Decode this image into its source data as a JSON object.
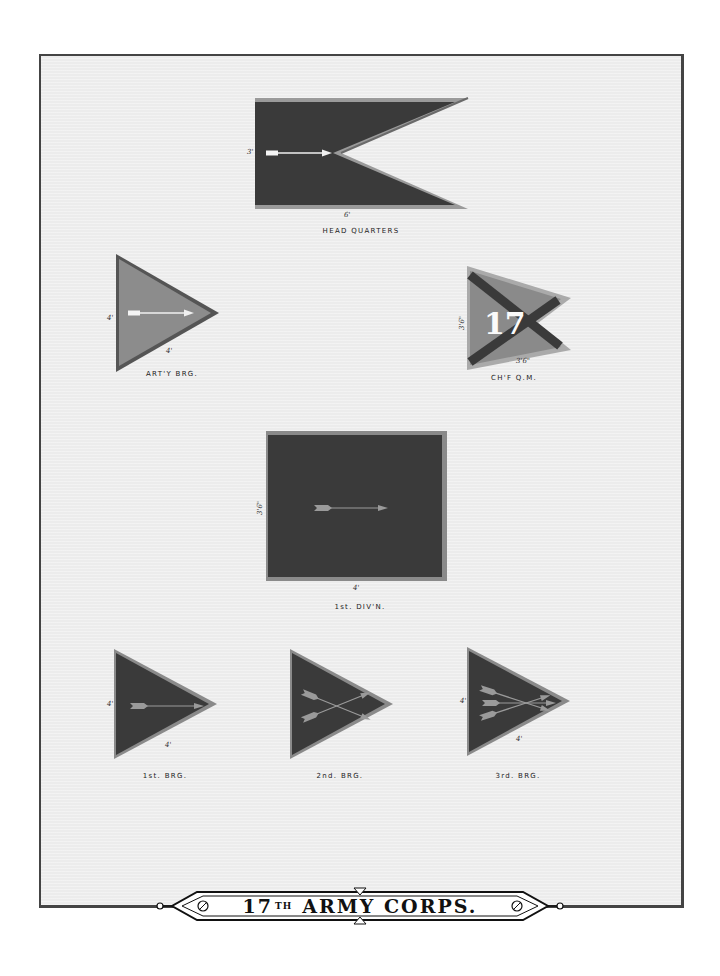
{
  "plate": {
    "title_number": "17",
    "title_suffix": "TH",
    "title_main": "ARMY CORPS.",
    "paper_color": "#ececec",
    "frame_color": "#444444"
  },
  "flags": [
    {
      "id": "head-quarters",
      "caption": "HEAD QUARTERS",
      "shape": "swallowtail",
      "field_color": "#3a3a3a",
      "border_color": "#9a9a9a",
      "emblem": "one white arrow",
      "dim_vertical": "3'",
      "dim_horizontal": "6'"
    },
    {
      "id": "arty-brig",
      "caption": "ART'Y BRG.",
      "shape": "triangle",
      "field_color": "#8c8c8c",
      "border_color": "#555555",
      "emblem": "one white arrow",
      "dim_vertical": "4'",
      "dim_horizontal": "4'"
    },
    {
      "id": "chief-qm",
      "caption": "CH'F Q.M.",
      "shape": "swallowtail-triangle",
      "field_color": "#8a8a8a",
      "border_color": "#aaaaaa",
      "emblem": "dark saltire with numeral",
      "numeral": "17",
      "dim_vertical": "3'6\"",
      "dim_horizontal": "3'6\""
    },
    {
      "id": "1st-divn",
      "caption": "1st. DIV'N.",
      "shape": "square",
      "field_color": "#3a3a3a",
      "border_color": "#8a8a8a",
      "emblem": "one arrow",
      "dim_vertical": "3'6\"",
      "dim_horizontal": "4'"
    },
    {
      "id": "1st-brg",
      "caption": "1st. BRG.",
      "shape": "triangle",
      "field_color": "#3a3a3a",
      "border_color": "#8a8a8a",
      "emblem": "one arrow",
      "dim_vertical": "4'",
      "dim_horizontal": "4'"
    },
    {
      "id": "2nd-brg",
      "caption": "2nd. BRG.",
      "shape": "triangle",
      "field_color": "#3a3a3a",
      "border_color": "#8a8a8a",
      "emblem": "two crossed arrows",
      "dim_vertical": "",
      "dim_horizontal": ""
    },
    {
      "id": "3rd-brg",
      "caption": "3rd. BRG.",
      "shape": "triangle",
      "field_color": "#3a3a3a",
      "border_color": "#8a8a8a",
      "emblem": "three crossed arrows",
      "dim_vertical": "4'",
      "dim_horizontal": "4'"
    }
  ]
}
